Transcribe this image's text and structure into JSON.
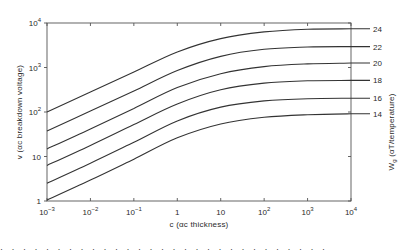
{
  "chart_data": {
    "type": "line",
    "title": "",
    "xlabel": "c (αc thickness)",
    "ylabel": "v (αc breakdown voltage)",
    "right_label": "W_g (αT/temperature)",
    "x_scale": "log",
    "y_scale": "log",
    "xlim": [
      0.001,
      10000
    ],
    "ylim": [
      1,
      10000
    ],
    "grid": false,
    "legend_position": "right, inline labels at curve ends",
    "x_ticks": [
      {
        "base": "10",
        "exp": "−3"
      },
      {
        "base": "10",
        "exp": "−2"
      },
      {
        "base": "10",
        "exp": "−1"
      },
      {
        "base": "1",
        "exp": ""
      },
      {
        "base": "10",
        "exp": ""
      },
      {
        "base": "10",
        "exp": "2"
      },
      {
        "base": "10",
        "exp": "3"
      },
      {
        "base": "10",
        "exp": "4"
      }
    ],
    "y_ticks": [
      {
        "base": "1",
        "exp": ""
      },
      {
        "base": "10",
        "exp": ""
      },
      {
        "base": "10",
        "exp": "2"
      },
      {
        "base": "10",
        "exp": "3"
      },
      {
        "base": "10",
        "exp": "4"
      }
    ],
    "x": [
      0.001,
      0.01,
      0.1,
      1,
      10,
      100,
      1000,
      10000
    ],
    "x_log10": [
      -3,
      -2,
      -1,
      0,
      1,
      2,
      3,
      4
    ],
    "series": [
      {
        "name": "24",
        "values_log10": [
          2.0,
          2.45,
          2.9,
          3.35,
          3.65,
          3.8,
          3.86,
          3.87
        ],
        "values": [
          100,
          282,
          794,
          2239,
          4467,
          6310,
          7244,
          7413
        ]
      },
      {
        "name": "22",
        "values_log10": [
          1.57,
          2.02,
          2.47,
          2.93,
          3.25,
          3.41,
          3.46,
          3.47
        ],
        "values": [
          37,
          105,
          295,
          851,
          1778,
          2570,
          2884,
          2951
        ]
      },
      {
        "name": "20",
        "values_log10": [
          1.17,
          1.62,
          2.08,
          2.55,
          2.86,
          3.02,
          3.08,
          3.1
        ],
        "values": [
          15,
          42,
          120,
          355,
          724,
          1047,
          1202,
          1259
        ]
      },
      {
        "name": "18",
        "values_log10": [
          0.8,
          1.25,
          1.72,
          2.18,
          2.5,
          2.65,
          2.7,
          2.71
        ],
        "values": [
          6.3,
          17.8,
          52,
          151,
          316,
          447,
          501,
          513
        ]
      },
      {
        "name": "16",
        "values_log10": [
          0.4,
          0.85,
          1.32,
          1.8,
          2.11,
          2.25,
          2.3,
          2.31
        ],
        "values": [
          2.5,
          7.1,
          21,
          63,
          129,
          178,
          200,
          204
        ]
      },
      {
        "name": "14",
        "values_log10": [
          0.02,
          0.47,
          0.94,
          1.42,
          1.73,
          1.88,
          1.94,
          1.96
        ],
        "values": [
          1.05,
          3.0,
          8.7,
          26,
          54,
          76,
          87,
          91
        ]
      }
    ]
  },
  "labels": {
    "x_axis_title": "c (αc thickness)",
    "y_axis_title": "v (αc breakdown voltage)",
    "right_axis_title_main": "W",
    "right_axis_title_sub": "g",
    "right_axis_title_rest": " (αT/temperature)"
  },
  "caption_fragment": "· · ·  · · ·   · · ·  · · ·   · · · ·  · · ·   · ·  · · ·  · ·  · · ·"
}
